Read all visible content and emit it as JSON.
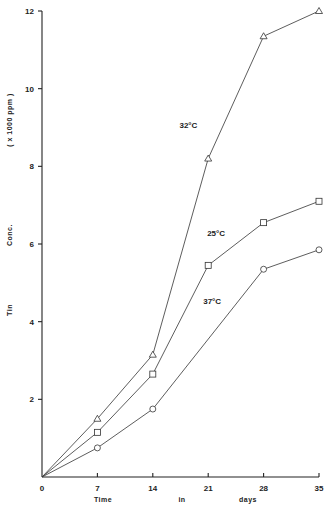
{
  "chart_data": {
    "type": "line",
    "title": "",
    "xlabel": "Time in days",
    "xlabel_parts": [
      "Time",
      "in",
      "days"
    ],
    "ylabel": "Tin Conc. ( x 1000 ppm )",
    "ylabel_parts": [
      "Tin",
      "Conc.",
      "( x 1000 ppm )"
    ],
    "x": [
      0,
      7,
      14,
      21,
      28,
      35
    ],
    "xlim": [
      0,
      35
    ],
    "ylim": [
      0,
      12
    ],
    "xticks": [
      0,
      7,
      14,
      21,
      28,
      35
    ],
    "yticks": [
      2,
      4,
      6,
      8,
      10,
      12
    ],
    "grid": false,
    "legend": "inline labels",
    "series": [
      {
        "name": "32°C",
        "marker": "triangle",
        "x": [
          0,
          7,
          14,
          21,
          28,
          35
        ],
        "values": [
          0,
          1.5,
          3.15,
          8.2,
          11.35,
          12.0
        ]
      },
      {
        "name": "25°C",
        "marker": "square",
        "x": [
          0,
          7,
          14,
          21,
          28,
          35
        ],
        "values": [
          0,
          1.15,
          2.65,
          5.45,
          6.55,
          7.1
        ]
      },
      {
        "name": "37°C",
        "marker": "circle",
        "x": [
          0,
          7,
          14,
          28,
          35
        ],
        "values": [
          0,
          0.75,
          1.75,
          5.35,
          5.85
        ]
      }
    ],
    "annotations": [
      {
        "text": "32°C",
        "x": 18.5,
        "y": 9.0
      },
      {
        "text": "25°C",
        "x": 22.0,
        "y": 6.2
      },
      {
        "text": "37°C",
        "x": 21.5,
        "y": 4.45
      }
    ]
  }
}
